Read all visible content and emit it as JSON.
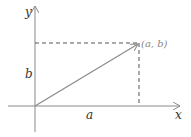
{
  "diagram": {
    "labels": {
      "y_axis": "y",
      "x_axis": "x",
      "point": "(a, b)",
      "horizontal_component": "a",
      "vertical_component": "b"
    },
    "colors": {
      "axes": "#8a8a8a",
      "vector": "#8a8a8a",
      "dashed": "#555555",
      "text": "#333333"
    }
  }
}
